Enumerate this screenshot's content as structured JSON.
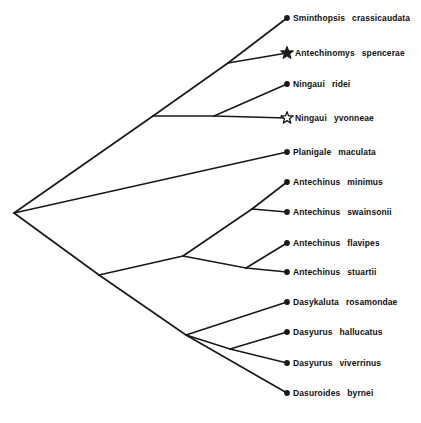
{
  "figure": {
    "name": "dasyurid-phylogeny",
    "type": "cladogram",
    "background_color": "#ffffff",
    "line_color": "#1a1a1a",
    "tip_marker": "filled-circle",
    "root": {
      "x": 14,
      "y": 213
    }
  },
  "symbols": {
    "filled_star": "★",
    "open_star": "☆",
    "tip_dot": "●"
  },
  "taxa": [
    {
      "id": "sminthopsis-crassicaudata",
      "genus": "Sminthopsis",
      "species": "crassicaudata",
      "marker": "dot",
      "tip": {
        "x": 287,
        "y": 18
      },
      "label": {
        "x": 293,
        "y": 18
      }
    },
    {
      "id": "antechinomys-spencerae",
      "genus": "Antechinomys",
      "species": "spencerae",
      "marker": "filled-star",
      "tip": {
        "x": 287,
        "y": 53
      },
      "label": {
        "x": 295,
        "y": 53
      }
    },
    {
      "id": "ningaui-ridei",
      "genus": "Ningaui",
      "species": "ridei",
      "marker": "dot",
      "tip": {
        "x": 287,
        "y": 84
      },
      "label": {
        "x": 293,
        "y": 84
      }
    },
    {
      "id": "ningaui-yvonneae",
      "genus": "Ningaui",
      "species": "yvonneae",
      "marker": "open-star",
      "tip": {
        "x": 287,
        "y": 118
      },
      "label": {
        "x": 295,
        "y": 118
      }
    },
    {
      "id": "planigale-maculata",
      "genus": "Planigale",
      "species": "maculata",
      "marker": "dot",
      "tip": {
        "x": 287,
        "y": 152
      },
      "label": {
        "x": 293,
        "y": 152
      }
    },
    {
      "id": "antechinus-minimus",
      "genus": "Antechinus",
      "species": "minimus",
      "marker": "dot",
      "tip": {
        "x": 287,
        "y": 182
      },
      "label": {
        "x": 293,
        "y": 182
      }
    },
    {
      "id": "antechinus-swainsonii",
      "genus": "Antechinus",
      "species": "swainsonii",
      "marker": "dot",
      "tip": {
        "x": 287,
        "y": 212
      },
      "label": {
        "x": 293,
        "y": 212
      }
    },
    {
      "id": "antechinus-flavipes",
      "genus": "Antechinus",
      "species": "flavipes",
      "marker": "dot",
      "tip": {
        "x": 287,
        "y": 243
      },
      "label": {
        "x": 293,
        "y": 243
      }
    },
    {
      "id": "antechinus-stuartii",
      "genus": "Antechinus",
      "species": "stuartii",
      "marker": "dot",
      "tip": {
        "x": 287,
        "y": 272
      },
      "label": {
        "x": 293,
        "y": 272
      }
    },
    {
      "id": "dasykaluta-rosamondae",
      "genus": "Dasykaluta",
      "species": "rosamondae",
      "marker": "dot",
      "tip": {
        "x": 287,
        "y": 302
      },
      "label": {
        "x": 293,
        "y": 302
      }
    },
    {
      "id": "dasyurus-hallucatus",
      "genus": "Dasyurus",
      "species": "hallucatus",
      "marker": "dot",
      "tip": {
        "x": 287,
        "y": 332
      },
      "label": {
        "x": 293,
        "y": 332
      }
    },
    {
      "id": "dasyurus-viverrinus",
      "genus": "Dasyurus",
      "species": "viverrinus",
      "marker": "dot",
      "tip": {
        "x": 287,
        "y": 363
      },
      "label": {
        "x": 293,
        "y": 363
      }
    },
    {
      "id": "dasuroides-byrnei",
      "genus": "Dasuroides",
      "species": "byrnei",
      "marker": "dot",
      "tip": {
        "x": 287,
        "y": 393
      },
      "label": {
        "x": 293,
        "y": 393
      }
    }
  ],
  "nodes": [
    {
      "id": "root",
      "x": 14,
      "y": 213
    },
    {
      "id": "sminthopsine-clade",
      "x": 153,
      "y": 116
    },
    {
      "id": "sminthopsis-antechinomys-node",
      "x": 228,
      "y": 63
    },
    {
      "id": "ningaui-node",
      "x": 214,
      "y": 116
    },
    {
      "id": "lower-clade",
      "x": 99,
      "y": 275
    },
    {
      "id": "antechinus-clade",
      "x": 183,
      "y": 256
    },
    {
      "id": "minimus-swainsonii-node",
      "x": 252,
      "y": 209
    },
    {
      "id": "flavipes-stuartii-node",
      "x": 246,
      "y": 268
    },
    {
      "id": "dasyurine-clade",
      "x": 186,
      "y": 335
    },
    {
      "id": "hallucatus-viverrinus-node",
      "x": 230,
      "y": 349
    }
  ],
  "branches": [
    {
      "id": "root-to-sminthopsine",
      "from": "root",
      "to": "sminthopsine-clade"
    },
    {
      "id": "root-to-planigale",
      "from": "root",
      "to": "planigale-maculata"
    },
    {
      "id": "root-to-lower",
      "from": "root",
      "to": "lower-clade"
    },
    {
      "id": "sminthopsine-to-pair",
      "from": "sminthopsine-clade",
      "to": "sminthopsis-antechinomys-node"
    },
    {
      "id": "sminthopsine-to-ningaui",
      "from": "sminthopsine-clade",
      "to": "ningaui-node"
    },
    {
      "id": "pair-to-sminthopsis",
      "from": "sminthopsis-antechinomys-node",
      "to": "sminthopsis-crassicaudata"
    },
    {
      "id": "pair-to-antechinomys",
      "from": "sminthopsis-antechinomys-node",
      "to": "antechinomys-spencerae"
    },
    {
      "id": "ningaui-to-ridei",
      "from": "ningaui-node",
      "to": "ningaui-ridei"
    },
    {
      "id": "ningaui-to-yvonneae",
      "from": "ningaui-node",
      "to": "ningaui-yvonneae"
    },
    {
      "id": "lower-to-antechinus",
      "from": "lower-clade",
      "to": "antechinus-clade"
    },
    {
      "id": "lower-to-dasyurine",
      "from": "lower-clade",
      "to": "dasyurine-clade"
    },
    {
      "id": "antechinus-to-ms",
      "from": "antechinus-clade",
      "to": "minimus-swainsonii-node"
    },
    {
      "id": "antechinus-to-fs",
      "from": "antechinus-clade",
      "to": "flavipes-stuartii-node"
    },
    {
      "id": "ms-to-minimus",
      "from": "minimus-swainsonii-node",
      "to": "antechinus-minimus"
    },
    {
      "id": "ms-to-swainsonii",
      "from": "minimus-swainsonii-node",
      "to": "antechinus-swainsonii"
    },
    {
      "id": "fs-to-flavipes",
      "from": "flavipes-stuartii-node",
      "to": "antechinus-flavipes"
    },
    {
      "id": "fs-to-stuartii",
      "from": "flavipes-stuartii-node",
      "to": "antechinus-stuartii"
    },
    {
      "id": "dasyurine-to-dasykaluta",
      "from": "dasyurine-clade",
      "to": "dasykaluta-rosamondae"
    },
    {
      "id": "dasyurine-to-hv",
      "from": "dasyurine-clade",
      "to": "hallucatus-viverrinus-node"
    },
    {
      "id": "dasyurine-to-byrnei",
      "from": "dasyurine-clade",
      "to": "dasuroides-byrnei"
    },
    {
      "id": "hv-to-hallucatus",
      "from": "hallucatus-viverrinus-node",
      "to": "dasyurus-hallucatus"
    },
    {
      "id": "hv-to-viverrinus",
      "from": "hallucatus-viverrinus-node",
      "to": "dasyurus-viverrinus"
    }
  ]
}
